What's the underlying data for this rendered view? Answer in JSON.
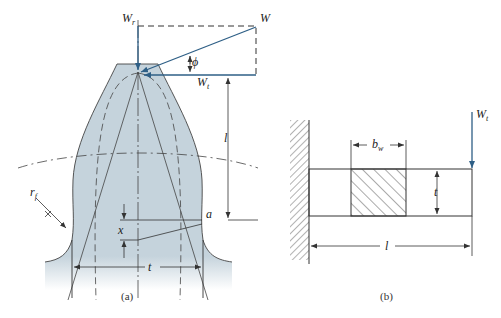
{
  "figure_a": {
    "caption": "(a)",
    "labels": {
      "W_r": "W",
      "W_r_sub": "r",
      "W": "W",
      "phi": "ϕ",
      "W_t": "W",
      "W_t_sub": "t",
      "l": "l",
      "r_f": "r",
      "r_f_sub": "f",
      "a": "a",
      "x": "x",
      "t": "t"
    },
    "colors": {
      "tooth_fill": "#c5d3dc",
      "force_arrow": "#2e5f86",
      "line": "#333333"
    }
  },
  "figure_b": {
    "caption": "(b)",
    "labels": {
      "W_t": "W",
      "W_t_sub": "t",
      "b_w": "b",
      "b_w_sub": "w",
      "t": "t",
      "l": "l"
    },
    "colors": {
      "force_arrow": "#2e5f86",
      "line": "#333333",
      "hatch": "#555555"
    }
  }
}
